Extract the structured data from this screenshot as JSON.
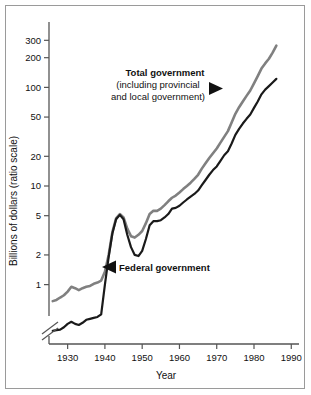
{
  "figure": {
    "name": "government-spending-ratio-scale-chart",
    "background_color": "#ffffff",
    "border_color": "#9a9a9a"
  },
  "chart_data": {
    "type": "line",
    "title": "",
    "subtitle": "",
    "xlabel": "Year",
    "ylabel": "Billions of dollars (ratio scale)",
    "yscale": "log",
    "ylim": [
      0.25,
      400
    ],
    "xlim": [
      1925,
      1991
    ],
    "grid": false,
    "legend": "annotations-on-plot",
    "y_tick_labels": [
      "300",
      "200",
      "100",
      "50",
      "20",
      "10",
      "5",
      "2",
      "1"
    ],
    "y_tick_values": [
      300,
      200,
      100,
      50,
      20,
      10,
      5,
      2,
      1
    ],
    "x_tick_labels": [
      "1930",
      "1940",
      "1950",
      "1960",
      "1970",
      "1980",
      "1990"
    ],
    "x_tick_values": [
      1930,
      1940,
      1950,
      1960,
      1970,
      1980,
      1990
    ],
    "axis_break": "y-axis break below lowest data (double slash)",
    "series": [
      {
        "name": "Total government (including provincial and local government)",
        "color": "#808080",
        "x": [
          1926,
          1927,
          1928,
          1929,
          1930,
          1931,
          1932,
          1933,
          1934,
          1935,
          1936,
          1937,
          1938,
          1939,
          1940,
          1941,
          1942,
          1943,
          1944,
          1945,
          1946,
          1947,
          1948,
          1949,
          1950,
          1951,
          1952,
          1953,
          1954,
          1955,
          1956,
          1957,
          1958,
          1959,
          1960,
          1961,
          1962,
          1963,
          1964,
          1965,
          1966,
          1967,
          1968,
          1969,
          1970,
          1971,
          1972,
          1973,
          1974,
          1975,
          1976,
          1977,
          1978,
          1979,
          1980,
          1981,
          1982,
          1983,
          1984,
          1985,
          1986
        ],
        "values": [
          0.68,
          0.7,
          0.74,
          0.78,
          0.85,
          0.95,
          0.92,
          0.88,
          0.92,
          0.95,
          0.97,
          1.02,
          1.05,
          1.1,
          1.35,
          2.0,
          3.4,
          4.7,
          5.2,
          4.8,
          3.7,
          3.1,
          3.0,
          3.2,
          3.5,
          4.2,
          5.2,
          5.6,
          5.6,
          5.9,
          6.4,
          7.0,
          7.6,
          8.0,
          8.6,
          9.3,
          10.0,
          10.8,
          11.8,
          13.0,
          15.0,
          17.0,
          19.2,
          21.5,
          24.0,
          27.5,
          31.5,
          36.0,
          44.0,
          54.0,
          63.0,
          72.0,
          82.0,
          93.0,
          110.0,
          130.0,
          155.0,
          175.0,
          195.0,
          225.0,
          265.0
        ]
      },
      {
        "name": "Federal government",
        "color": "#1a1a1a",
        "x": [
          1926,
          1927,
          1928,
          1929,
          1930,
          1931,
          1932,
          1933,
          1934,
          1935,
          1936,
          1937,
          1938,
          1939,
          1940,
          1941,
          1942,
          1943,
          1944,
          1945,
          1946,
          1947,
          1948,
          1949,
          1950,
          1951,
          1952,
          1953,
          1954,
          1955,
          1956,
          1957,
          1958,
          1959,
          1960,
          1961,
          1962,
          1963,
          1964,
          1965,
          1966,
          1967,
          1968,
          1969,
          1970,
          1971,
          1972,
          1973,
          1974,
          1975,
          1976,
          1977,
          1978,
          1979,
          1980,
          1981,
          1982,
          1983,
          1984,
          1985,
          1986
        ],
        "values": [
          0.34,
          0.345,
          0.35,
          0.37,
          0.4,
          0.42,
          0.4,
          0.39,
          0.41,
          0.44,
          0.45,
          0.46,
          0.47,
          0.5,
          1.0,
          1.9,
          3.3,
          4.6,
          5.1,
          4.6,
          3.2,
          2.4,
          2.0,
          1.95,
          2.2,
          2.9,
          4.0,
          4.4,
          4.4,
          4.5,
          4.8,
          5.2,
          5.9,
          6.0,
          6.3,
          6.8,
          7.3,
          7.8,
          8.3,
          9.0,
          10.2,
          11.5,
          13.0,
          14.5,
          15.8,
          18.0,
          20.5,
          22.5,
          27.0,
          33.0,
          38.0,
          43.0,
          48.0,
          53.0,
          62.0,
          72.0,
          85.0,
          95.0,
          103.0,
          112.0,
          122.0
        ]
      }
    ],
    "annotations": [
      {
        "name": "total-government-annotation",
        "lines": [
          "Total government",
          "(including provincial",
          "and local government)"
        ],
        "arrow": "right",
        "target_series": "Total government (including provincial and local government)"
      },
      {
        "name": "federal-government-annotation",
        "lines": [
          "Federal government"
        ],
        "arrow": "left",
        "target_series": "Federal government"
      }
    ]
  }
}
